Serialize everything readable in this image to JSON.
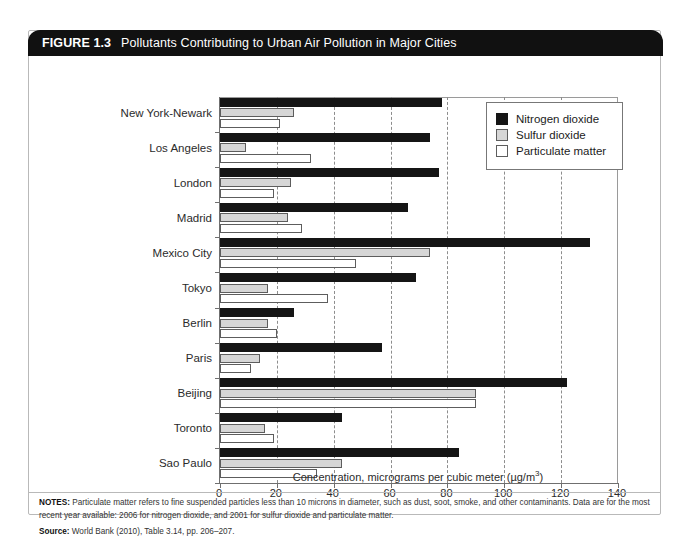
{
  "figure": {
    "number": "FIGURE 1.3",
    "title": "Pollutants Contributing to Urban Air Pollution in Major Cities"
  },
  "notes": {
    "label": "NOTES:",
    "line1": "Particulate matter refers to fine suspended particles less than 10 microns in diameter, such as dust, soot, smoke, and other contaminants.",
    "line2": "Data are for the most recent year available: 2006 for nitrogen dioxide, and 2001 for sulfur dioxide and particulate matter.",
    "source_label": "Source:",
    "source_text": "World Bank (2010), Table 3.14, pp. 206–207."
  },
  "colors": {
    "nitrogen_dioxide": "#151515",
    "sulfur_dioxide": "#d6d6d6",
    "particulate_matter": "#ffffff",
    "header_bar": "#111111",
    "frame": "#b9b9b9",
    "gridline": "#8d8d8d"
  },
  "chart_data": {
    "type": "bar",
    "orientation": "horizontal",
    "title": "Pollutants Contributing to Urban Air Pollution in Major Cities",
    "xlabel": "Concentration, micrograms per cubic meter (µg/m3)",
    "xlabel_unit_base": "Concentration, micrograms per cubic meter (µg/m",
    "xlabel_unit_sup": "3",
    "xlabel_unit_tail": ")",
    "ylabel": "",
    "xlim": [
      0,
      140
    ],
    "xticks": [
      0,
      20,
      40,
      60,
      80,
      100,
      120,
      140
    ],
    "grid": "vertical-dashed",
    "legend_position": "top-right",
    "categories": [
      "New York-Newark",
      "Los Angeles",
      "London",
      "Madrid",
      "Mexico City",
      "Tokyo",
      "Berlin",
      "Paris",
      "Beijing",
      "Toronto",
      "Sao Paulo"
    ],
    "series": [
      {
        "name": "Nitrogen dioxide",
        "color": "#151515",
        "values": [
          78,
          74,
          77,
          66,
          130,
          69,
          26,
          57,
          122,
          43,
          84
        ]
      },
      {
        "name": "Sulfur dioxide",
        "color": "#d6d6d6",
        "values": [
          26,
          9,
          25,
          24,
          74,
          17,
          17,
          14,
          90,
          16,
          43
        ]
      },
      {
        "name": "Particulate matter",
        "color": "#ffffff",
        "values": [
          21,
          32,
          19,
          29,
          48,
          38,
          20,
          11,
          90,
          19,
          34
        ]
      }
    ]
  }
}
